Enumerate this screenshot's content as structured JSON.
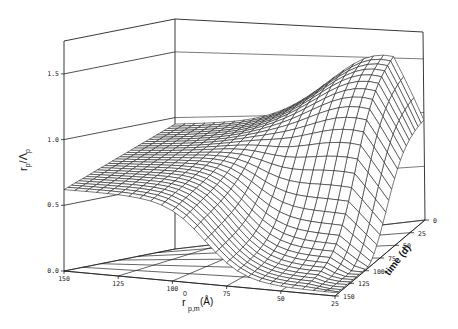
{
  "chart_data": {
    "type": "surface3d",
    "title": "",
    "xlabel": "r0_p,m (Å)",
    "xlabel_parts": {
      "main": "r",
      "sup": "0",
      "sub": "p,m",
      "unit": "(Å)"
    },
    "ylabel": "time (d)",
    "zlabel": "r_p/Λ_p",
    "zlabel_parts": {
      "r": "r",
      "rsub": "p",
      "slash": "/",
      "L": "Λ",
      "Lsub": "p"
    },
    "x_ticks": [
      "150",
      "125",
      "100",
      "75",
      "50",
      "25"
    ],
    "x_range": [
      150,
      25
    ],
    "y_ticks": [
      "0",
      "25",
      "50",
      "75",
      "100",
      "125",
      "150"
    ],
    "y_range": [
      0,
      150
    ],
    "z_ticks": [
      "0.0",
      "0.5",
      "1.0",
      "1.5"
    ],
    "zlim": [
      0,
      1.75
    ],
    "grid": {
      "nx": 26,
      "ny": 31
    },
    "surface_description": "z rises with time for small r0 (peak ~1.55 near r0≈40-60 Å, t≈0-25 d); large r0 plane ~0.6-0.75 sloping up toward back; deep valley to ~0 near r0≈25-60 Å at large time",
    "sample_values": [
      {
        "r0": 150,
        "t": 150,
        "z": 0.62
      },
      {
        "r0": 150,
        "t": 0,
        "z": 0.95
      },
      {
        "r0": 100,
        "t": 150,
        "z": 0.6
      },
      {
        "r0": 75,
        "t": 150,
        "z": 0.3
      },
      {
        "r0": 50,
        "t": 150,
        "z": 0.02
      },
      {
        "r0": 25,
        "t": 150,
        "z": 0.01
      },
      {
        "r0": 50,
        "t": 0,
        "z": 1.55
      },
      {
        "r0": 25,
        "t": 0,
        "z": 0.9
      }
    ]
  }
}
